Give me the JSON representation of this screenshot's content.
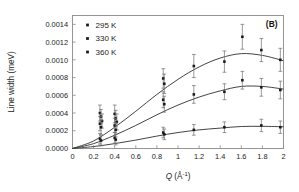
{
  "figure": {
    "panel_label": "(B)",
    "background": "#ffffff",
    "frame_color": "#8a8a8a",
    "curve_color": "#3a3a3a",
    "marker_color": "#1a1a1a",
    "errorbar_color": "#6e6e6e"
  },
  "chart_data": {
    "type": "scatter",
    "title": "",
    "panel": "(B)",
    "xlabel": "Q (Å⁻¹)",
    "xlabel_parts": {
      "symbol": "Q",
      "unit_open": " (Å",
      "exponent": "-1",
      "unit_close": ")"
    },
    "ylabel": "Line width (meV)",
    "xlim": [
      0,
      2
    ],
    "ylim": [
      0,
      0.0015
    ],
    "xticks": [
      0,
      0.2,
      0.4,
      0.6,
      0.8,
      1,
      1.2,
      1.4,
      1.6,
      1.8,
      2
    ],
    "xticklabels": [
      "0",
      "0.2",
      "0.4",
      "0.6",
      "0.8",
      "1",
      "1.2",
      "1.4",
      "1.6",
      "1.8",
      "2"
    ],
    "yticks": [
      0.0,
      0.0002,
      0.0004,
      0.0006,
      0.0008,
      0.001,
      0.0012,
      0.0014
    ],
    "yticklabels": [
      "0.0000",
      "0.0002",
      "0.0004",
      "0.0006",
      "0.0008",
      "0.0010",
      "0.0012",
      "0.0014"
    ],
    "grid": false,
    "legend_position": "top-left",
    "legend": [
      "295 K",
      "330 K",
      "360 K"
    ],
    "series": [
      {
        "name": "295 K",
        "marker": "square",
        "points": [
          {
            "x": 0.26,
            "y": 0.0004,
            "err": 9e-05
          },
          {
            "x": 0.27,
            "y": 0.00036,
            "err": 8e-05
          },
          {
            "x": 0.28,
            "y": 0.00031,
            "err": 8e-05
          },
          {
            "x": 0.4,
            "y": 0.00039,
            "err": 0.0001
          },
          {
            "x": 0.41,
            "y": 0.00034,
            "err": 9e-05
          },
          {
            "x": 0.42,
            "y": 0.0003,
            "err": 9e-05
          },
          {
            "x": 0.86,
            "y": 0.00079,
            "err": 0.00011
          },
          {
            "x": 0.87,
            "y": 0.00073,
            "err": 0.00011
          },
          {
            "x": 1.15,
            "y": 0.00093,
            "err": 0.00013
          },
          {
            "x": 1.44,
            "y": 0.00098,
            "err": 0.00012
          },
          {
            "x": 1.61,
            "y": 0.00126,
            "err": 0.00014
          },
          {
            "x": 1.79,
            "y": 0.00111,
            "err": 0.00013
          },
          {
            "x": 1.97,
            "y": 0.001,
            "err": 0.00013
          }
        ],
        "fit": {
          "peak_x": 1.62,
          "peak_y": 0.00107,
          "values": [
            {
              "x": 0.0,
              "y": 0.0
            },
            {
              "x": 0.2,
              "y": 8.5e-05
            },
            {
              "x": 0.4,
              "y": 0.00024
            },
            {
              "x": 0.6,
              "y": 0.00042
            },
            {
              "x": 0.8,
              "y": 0.00061
            },
            {
              "x": 1.0,
              "y": 0.00078
            },
            {
              "x": 1.2,
              "y": 0.00092
            },
            {
              "x": 1.4,
              "y": 0.00102
            },
            {
              "x": 1.6,
              "y": 0.00107
            },
            {
              "x": 1.8,
              "y": 0.00105
            },
            {
              "x": 2.0,
              "y": 0.00099
            }
          ]
        }
      },
      {
        "name": "330 K",
        "marker": "square",
        "points": [
          {
            "x": 0.26,
            "y": 0.00028,
            "err": 8e-05
          },
          {
            "x": 0.27,
            "y": 0.00024,
            "err": 8e-05
          },
          {
            "x": 0.4,
            "y": 0.00026,
            "err": 8e-05
          },
          {
            "x": 0.41,
            "y": 0.00021,
            "err": 8e-05
          },
          {
            "x": 0.86,
            "y": 0.00055,
            "err": 9e-05
          },
          {
            "x": 0.87,
            "y": 0.0005,
            "err": 9e-05
          },
          {
            "x": 1.15,
            "y": 0.00061,
            "err": 0.0001
          },
          {
            "x": 1.44,
            "y": 0.00064,
            "err": 9e-05
          },
          {
            "x": 1.61,
            "y": 0.00077,
            "err": 0.0001
          },
          {
            "x": 1.79,
            "y": 0.00069,
            "err": 0.0001
          },
          {
            "x": 1.97,
            "y": 0.00066,
            "err": 0.0001
          }
        ],
        "fit": {
          "peak_x": 1.66,
          "peak_y": 0.0007,
          "values": [
            {
              "x": 0.0,
              "y": 0.0
            },
            {
              "x": 0.2,
              "y": 5.5e-05
            },
            {
              "x": 0.4,
              "y": 0.00015
            },
            {
              "x": 0.6,
              "y": 0.00026
            },
            {
              "x": 0.8,
              "y": 0.00038
            },
            {
              "x": 1.0,
              "y": 0.00049
            },
            {
              "x": 1.2,
              "y": 0.00058
            },
            {
              "x": 1.4,
              "y": 0.00065
            },
            {
              "x": 1.6,
              "y": 0.0007
            },
            {
              "x": 1.8,
              "y": 0.0007
            },
            {
              "x": 2.0,
              "y": 0.00067
            }
          ]
        }
      },
      {
        "name": "360 K",
        "marker": "square",
        "points": [
          {
            "x": 0.26,
            "y": 0.00011,
            "err": 6e-05
          },
          {
            "x": 0.27,
            "y": 9e-05,
            "err": 6e-05
          },
          {
            "x": 0.4,
            "y": 0.00012,
            "err": 6e-05
          },
          {
            "x": 0.41,
            "y": 0.0001,
            "err": 6e-05
          },
          {
            "x": 0.86,
            "y": 0.00018,
            "err": 6e-05
          },
          {
            "x": 0.87,
            "y": 0.00016,
            "err": 6e-05
          },
          {
            "x": 1.15,
            "y": 0.00021,
            "err": 6e-05
          },
          {
            "x": 1.44,
            "y": 0.00024,
            "err": 6e-05
          },
          {
            "x": 1.79,
            "y": 0.00026,
            "err": 7e-05
          },
          {
            "x": 1.97,
            "y": 0.00024,
            "err": 7e-05
          }
        ],
        "fit": {
          "peak_x": 1.7,
          "peak_y": 0.00025,
          "values": [
            {
              "x": 0.0,
              "y": 0.0
            },
            {
              "x": 0.2,
              "y": 2.2e-05
            },
            {
              "x": 0.4,
              "y": 5.5e-05
            },
            {
              "x": 0.6,
              "y": 9.5e-05
            },
            {
              "x": 0.8,
              "y": 0.00014
            },
            {
              "x": 1.0,
              "y": 0.00018
            },
            {
              "x": 1.2,
              "y": 0.00021
            },
            {
              "x": 1.4,
              "y": 0.00023
            },
            {
              "x": 1.6,
              "y": 0.000248
            },
            {
              "x": 1.8,
              "y": 0.00025
            },
            {
              "x": 2.0,
              "y": 0.000245
            }
          ]
        }
      }
    ]
  }
}
